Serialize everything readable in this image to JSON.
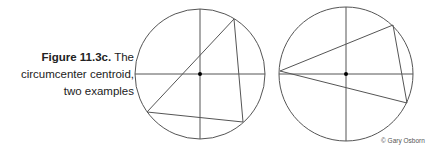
{
  "caption": {
    "label": "Figure 11.3c.",
    "text_line1": " The",
    "text_line2": "circumcenter centroid,",
    "text_line3": "two examples"
  },
  "credit": "© Gary Osborn",
  "colors": {
    "stroke": "#555555",
    "center": "#000000",
    "text": "#222222"
  },
  "diagrams": [
    {
      "name": "example-1",
      "center": [
        200,
        74
      ],
      "radius": 65,
      "triangle": [
        [
          234,
          19
        ],
        [
          147,
          112
        ],
        [
          243,
          122
        ]
      ]
    },
    {
      "name": "example-2",
      "center": [
        346,
        74
      ],
      "radius": 67,
      "triangle": [
        [
          280,
          71
        ],
        [
          393,
          25
        ],
        [
          407,
          103
        ]
      ]
    }
  ]
}
